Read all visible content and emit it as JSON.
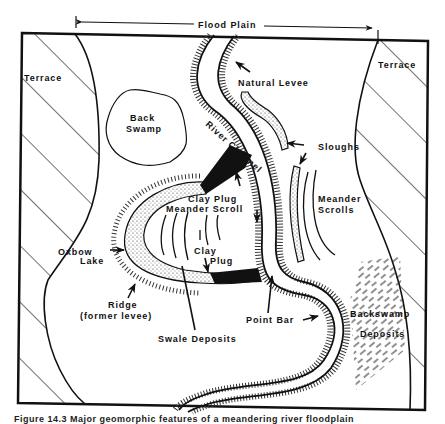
{
  "diagram": {
    "title_span_label": "Flood Plain",
    "labels": {
      "terrace_left": "Terrace",
      "terrace_right": "Terrace",
      "back_swamp_line1": "Back",
      "back_swamp_line2": "Swamp",
      "natural_levee": "Natural Levee",
      "river_channel": "River Channel",
      "sloughs": "Sloughs",
      "clay_plug_upper": "Clay Plug",
      "meander_scroll": "Meander Scroll",
      "meander_scrolls_line1": "Meander",
      "meander_scrolls_line2": "Scrolls",
      "oxbow_lake_line1": "Oxbow",
      "oxbow_lake_line2": "Lake",
      "clay_plug_lower_line1": "Clay",
      "clay_plug_lower_line2": "Plug",
      "ridge_line1": "Ridge",
      "ridge_line2": "(former levee)",
      "swale_deposits": "Swale Deposits",
      "point_bar": "Point Bar",
      "backswamp_deposits_line1": "Backswamp",
      "backswamp_deposits_line2": "Deposits"
    },
    "caption": "Figure 14.3   Major geomorphic features of a meandering river floodplain"
  }
}
